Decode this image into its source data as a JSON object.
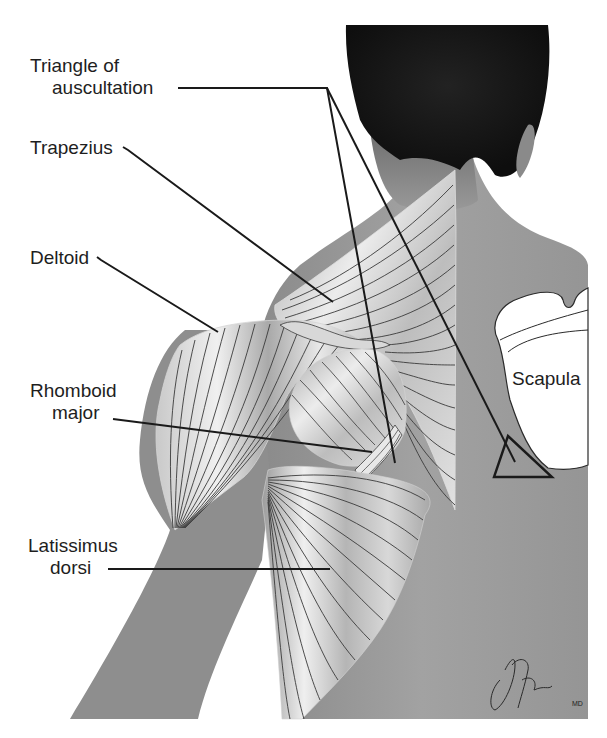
{
  "figure": {
    "type": "anatomical illustration",
    "colors": {
      "background": "#ffffff",
      "skin": "#9a9a9a",
      "skin_dark": "#7e7e7e",
      "hair": "#1a1a1a",
      "muscle_light": "#e6e6e6",
      "muscle_mid": "#b8b8b8",
      "fiber_line": "#3a3a3a",
      "leader_line": "#1a1a1a",
      "scapula": "#ffffff"
    }
  },
  "labels": [
    {
      "id": "triangle-of-auscultation",
      "lines": [
        "Triangle of",
        "auscultation"
      ]
    },
    {
      "id": "trapezius",
      "lines": [
        "Trapezius"
      ]
    },
    {
      "id": "deltoid",
      "lines": [
        "Deltoid"
      ]
    },
    {
      "id": "rhomboid-major",
      "lines": [
        "Rhomboid",
        "major"
      ]
    },
    {
      "id": "latissimus-dorsi",
      "lines": [
        "Latissimus",
        "dorsi"
      ]
    },
    {
      "id": "scapula",
      "lines": [
        "Scapula"
      ]
    }
  ],
  "signature": {
    "text": "JABrada",
    "suffix": "MD"
  }
}
